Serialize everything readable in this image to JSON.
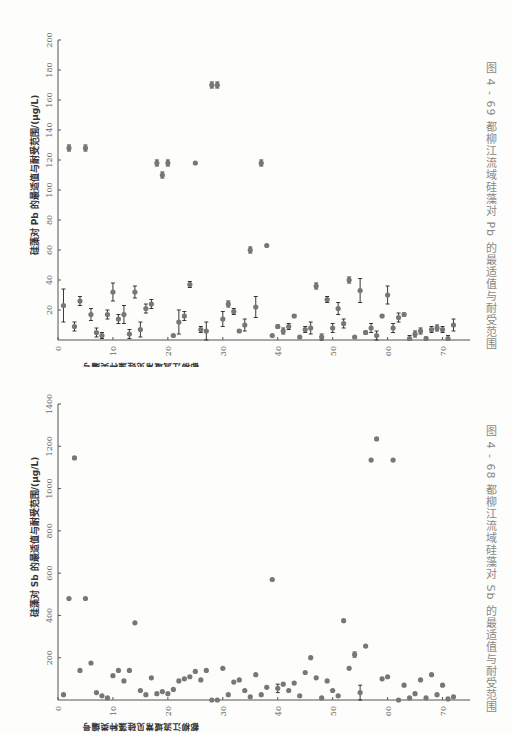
{
  "page": {
    "figures": [
      {
        "id": "fig-4-69",
        "caption": "图 4 - 69   都柳江流域硅藻对 Pb 的最适值与耐受范围",
        "ylabel": "硅藻对 Pb 的最适值与耐受范围/(μg/L)",
        "xlabel": "都柳江流域常见硅藻种类编号"
      },
      {
        "id": "fig-4-68",
        "caption": "图 4 - 68   都柳江流域硅藻对 Sb 的最适值与耐受范围",
        "ylabel": "硅藻对 Sb 的最适值与耐受范围/(μg/L)",
        "xlabel": "都柳江流域常见硅藻种类编号"
      }
    ]
  },
  "chart_data": [
    {
      "type": "scatter",
      "title": "都柳江流域硅藻对 Pb 的最适值与耐受范围",
      "figure_label": "图 4-69",
      "xlabel": "都柳江流域常见硅藻种类编号",
      "ylabel": "硅藻对 Pb 的最适值与耐受范围/(μg/L)",
      "xlim": [
        0,
        75
      ],
      "ylim": [
        0,
        200
      ],
      "xticks": [
        0,
        10,
        20,
        30,
        40,
        50,
        60,
        70
      ],
      "yticks": [
        20,
        40,
        60,
        80,
        100,
        120,
        140,
        160,
        180,
        200
      ],
      "grid": false,
      "orientation": "rotated 90° counter-clockwise on page",
      "points": [
        {
          "x": 1,
          "y": 23,
          "err": 11
        },
        {
          "x": 2,
          "y": 128,
          "err": 2
        },
        {
          "x": 3,
          "y": 9,
          "err": 3
        },
        {
          "x": 4,
          "y": 26,
          "err": 3
        },
        {
          "x": 5,
          "y": 128,
          "err": 2
        },
        {
          "x": 6,
          "y": 17,
          "err": 4
        },
        {
          "x": 7,
          "y": 5,
          "err": 3
        },
        {
          "x": 8,
          "y": 3,
          "err": 2
        },
        {
          "x": 9,
          "y": 17,
          "err": 3
        },
        {
          "x": 10,
          "y": 32,
          "err": 6
        },
        {
          "x": 11,
          "y": 14,
          "err": 3
        },
        {
          "x": 12,
          "y": 17,
          "err": 6
        },
        {
          "x": 13,
          "y": 4,
          "err": 3
        },
        {
          "x": 14,
          "y": 32,
          "err": 4
        },
        {
          "x": 15,
          "y": 7,
          "err": 5
        },
        {
          "x": 16,
          "y": 21,
          "err": 3
        },
        {
          "x": 17,
          "y": 24,
          "err": 3
        },
        {
          "x": 18,
          "y": 118,
          "err": 2
        },
        {
          "x": 19,
          "y": 110,
          "err": 2
        },
        {
          "x": 20,
          "y": 118,
          "err": 2
        },
        {
          "x": 21,
          "y": 3,
          "err": 0
        },
        {
          "x": 22,
          "y": 12,
          "err": 8
        },
        {
          "x": 23,
          "y": 16,
          "err": 3
        },
        {
          "x": 24,
          "y": 37,
          "err": 2
        },
        {
          "x": 25,
          "y": 118,
          "err": 0
        },
        {
          "x": 26,
          "y": 7,
          "err": 2
        },
        {
          "x": 27,
          "y": 6,
          "err": 6
        },
        {
          "x": 28,
          "y": 170,
          "err": 2
        },
        {
          "x": 29,
          "y": 170,
          "err": 2
        },
        {
          "x": 30,
          "y": 14,
          "err": 5
        },
        {
          "x": 31,
          "y": 24,
          "err": 2
        },
        {
          "x": 32,
          "y": 19,
          "err": 2
        },
        {
          "x": 33,
          "y": 6,
          "err": 1
        },
        {
          "x": 34,
          "y": 10,
          "err": 4
        },
        {
          "x": 35,
          "y": 60,
          "err": 2
        },
        {
          "x": 36,
          "y": 22,
          "err": 7
        },
        {
          "x": 37,
          "y": 118,
          "err": 2
        },
        {
          "x": 38,
          "y": 63,
          "err": 0
        },
        {
          "x": 39,
          "y": 3,
          "err": 0
        },
        {
          "x": 40,
          "y": 9,
          "err": 1
        },
        {
          "x": 41,
          "y": 6,
          "err": 2
        },
        {
          "x": 42,
          "y": 9,
          "err": 2
        },
        {
          "x": 43,
          "y": 16,
          "err": 1
        },
        {
          "x": 44,
          "y": 2,
          "err": 0
        },
        {
          "x": 45,
          "y": 7,
          "err": 2
        },
        {
          "x": 46,
          "y": 8,
          "err": 4
        },
        {
          "x": 47,
          "y": 36,
          "err": 2
        },
        {
          "x": 48,
          "y": 2,
          "err": 2
        },
        {
          "x": 49,
          "y": 27,
          "err": 2
        },
        {
          "x": 50,
          "y": 8,
          "err": 3
        },
        {
          "x": 51,
          "y": 21,
          "err": 4
        },
        {
          "x": 52,
          "y": 11,
          "err": 3
        },
        {
          "x": 53,
          "y": 40,
          "err": 2
        },
        {
          "x": 54,
          "y": 2,
          "err": 0
        },
        {
          "x": 55,
          "y": 33,
          "err": 8
        },
        {
          "x": 56,
          "y": 5,
          "err": 1
        },
        {
          "x": 57,
          "y": 8,
          "err": 3
        },
        {
          "x": 58,
          "y": 3,
          "err": 3
        },
        {
          "x": 59,
          "y": 16,
          "err": 1
        },
        {
          "x": 60,
          "y": 30,
          "err": 6
        },
        {
          "x": 61,
          "y": 8,
          "err": 3
        },
        {
          "x": 62,
          "y": 15,
          "err": 3
        },
        {
          "x": 63,
          "y": 17,
          "err": 1
        },
        {
          "x": 64,
          "y": 1,
          "err": 2
        },
        {
          "x": 65,
          "y": 4,
          "err": 2
        },
        {
          "x": 66,
          "y": 6,
          "err": 2
        },
        {
          "x": 67,
          "y": 1,
          "err": 1
        },
        {
          "x": 68,
          "y": 7,
          "err": 2
        },
        {
          "x": 69,
          "y": 8,
          "err": 2
        },
        {
          "x": 70,
          "y": 7,
          "err": 2
        },
        {
          "x": 71,
          "y": 1,
          "err": 2
        },
        {
          "x": 72,
          "y": 10,
          "err": 4
        }
      ]
    },
    {
      "type": "scatter",
      "title": "都柳江流域硅藻对 Sb 的最适值与耐受范围",
      "figure_label": "图 4-68",
      "xlabel": "都柳江流域常见硅藻种类编号",
      "ylabel": "硅藻对 Sb 的最适值与耐受范围/(μg/L)",
      "xlim": [
        0,
        75
      ],
      "ylim": [
        0,
        1400
      ],
      "xticks": [
        0,
        10,
        20,
        30,
        40,
        50,
        60,
        70
      ],
      "yticks": [
        200,
        400,
        600,
        800,
        1000,
        1200,
        1400
      ],
      "grid": false,
      "orientation": "rotated 90° counter-clockwise on page",
      "points": [
        {
          "x": 1,
          "y": 25
        },
        {
          "x": 2,
          "y": 480
        },
        {
          "x": 3,
          "y": 1145
        },
        {
          "x": 4,
          "y": 140
        },
        {
          "x": 5,
          "y": 480
        },
        {
          "x": 6,
          "y": 175
        },
        {
          "x": 7,
          "y": 35
        },
        {
          "x": 8,
          "y": 20
        },
        {
          "x": 9,
          "y": 10
        },
        {
          "x": 10,
          "y": 115
        },
        {
          "x": 11,
          "y": 140
        },
        {
          "x": 12,
          "y": 90
        },
        {
          "x": 13,
          "y": 140
        },
        {
          "x": 14,
          "y": 365
        },
        {
          "x": 15,
          "y": 45
        },
        {
          "x": 16,
          "y": 25
        },
        {
          "x": 17,
          "y": 105
        },
        {
          "x": 18,
          "y": 30
        },
        {
          "x": 19,
          "y": 40
        },
        {
          "x": 20,
          "y": 30
        },
        {
          "x": 21,
          "y": 50
        },
        {
          "x": 22,
          "y": 90
        },
        {
          "x": 23,
          "y": 100
        },
        {
          "x": 24,
          "y": 110
        },
        {
          "x": 25,
          "y": 135
        },
        {
          "x": 26,
          "y": 95
        },
        {
          "x": 27,
          "y": 140
        },
        {
          "x": 28,
          "y": 0
        },
        {
          "x": 29,
          "y": 0
        },
        {
          "x": 30,
          "y": 150
        },
        {
          "x": 31,
          "y": 25
        },
        {
          "x": 32,
          "y": 85
        },
        {
          "x": 33,
          "y": 95
        },
        {
          "x": 34,
          "y": 45
        },
        {
          "x": 35,
          "y": 15
        },
        {
          "x": 36,
          "y": 120
        },
        {
          "x": 37,
          "y": 25
        },
        {
          "x": 38,
          "y": 60
        },
        {
          "x": 39,
          "y": 570
        },
        {
          "x": 40,
          "y": 55,
          "err": 20
        },
        {
          "x": 41,
          "y": 75
        },
        {
          "x": 42,
          "y": 45
        },
        {
          "x": 43,
          "y": 80
        },
        {
          "x": 44,
          "y": 20
        },
        {
          "x": 45,
          "y": 130
        },
        {
          "x": 46,
          "y": 200
        },
        {
          "x": 47,
          "y": 105
        },
        {
          "x": 48,
          "y": 10
        },
        {
          "x": 49,
          "y": 90
        },
        {
          "x": 50,
          "y": 45
        },
        {
          "x": 51,
          "y": 20
        },
        {
          "x": 52,
          "y": 375
        },
        {
          "x": 53,
          "y": 150
        },
        {
          "x": 54,
          "y": 215,
          "err": 12
        },
        {
          "x": 55,
          "y": 35,
          "err": 35
        },
        {
          "x": 56,
          "y": 255
        },
        {
          "x": 57,
          "y": 1135
        },
        {
          "x": 58,
          "y": 1235
        },
        {
          "x": 59,
          "y": 100
        },
        {
          "x": 60,
          "y": 110
        },
        {
          "x": 61,
          "y": 1135
        },
        {
          "x": 62,
          "y": 0
        },
        {
          "x": 63,
          "y": 70
        },
        {
          "x": 64,
          "y": 10
        },
        {
          "x": 65,
          "y": 30
        },
        {
          "x": 66,
          "y": 95
        },
        {
          "x": 67,
          "y": 10
        },
        {
          "x": 68,
          "y": 120
        },
        {
          "x": 69,
          "y": 25
        },
        {
          "x": 70,
          "y": 70
        },
        {
          "x": 71,
          "y": 5
        },
        {
          "x": 72,
          "y": 15
        }
      ]
    }
  ]
}
